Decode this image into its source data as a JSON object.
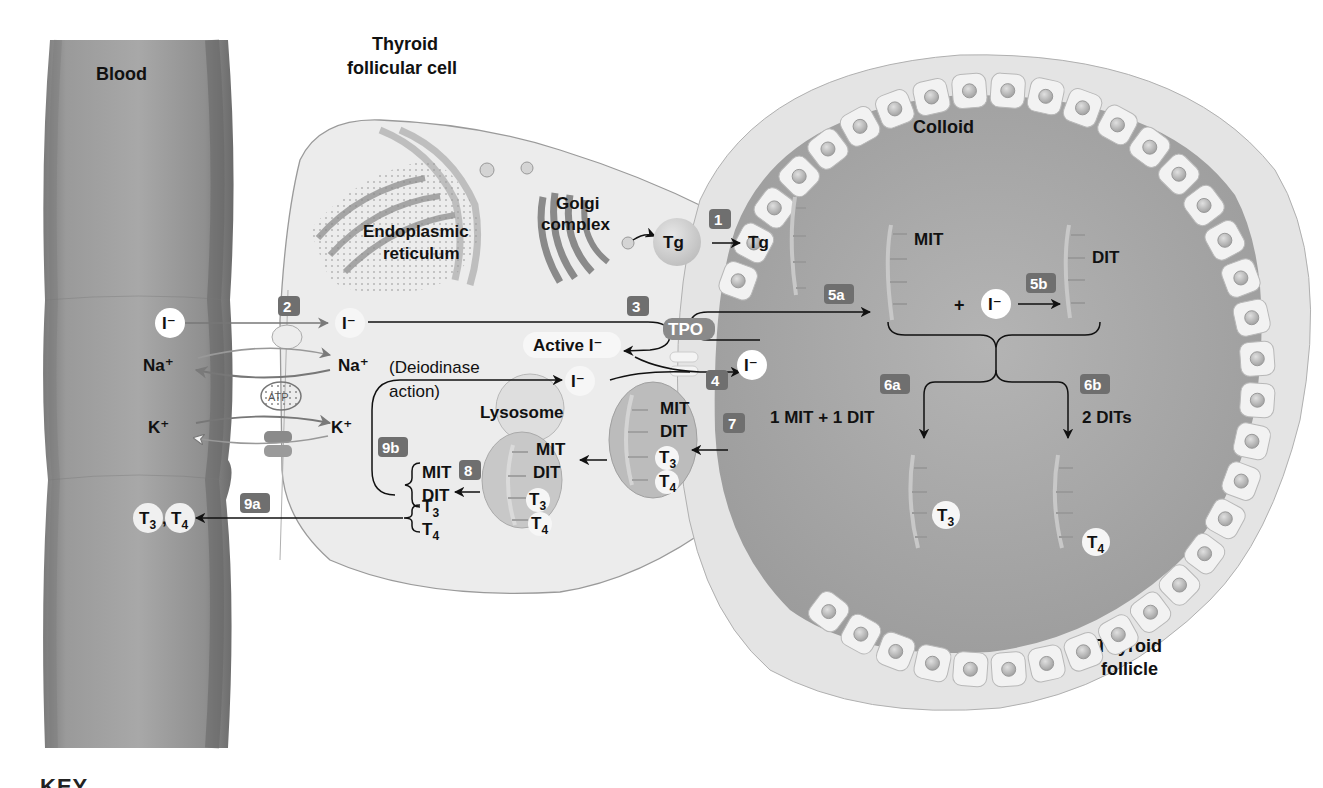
{
  "figure": {
    "key_header": "KEY"
  },
  "regions": {
    "blood": "Blood",
    "cell_title_line1": "Thyroid",
    "cell_title_line2": "follicular cell",
    "colloid": "Colloid",
    "follicle_line1": "Thyroid",
    "follicle_line2": "follicle",
    "er_line1": "Endoplasmic",
    "er_line2": "reticulum",
    "golgi_line1": "Golgi",
    "golgi_line2": "complex",
    "lysosome": "Lysosome"
  },
  "molecules": {
    "tg": "Tg",
    "iodide": "I⁻",
    "active_iodide": "Active I⁻",
    "na": "Na⁺",
    "k": "K⁺",
    "atp": "ATP",
    "tpo": "TPO",
    "mit": "MIT",
    "dit": "DIT",
    "t3": "T",
    "t3_sub": "3",
    "t4": "T",
    "t4_sub": "4",
    "t3_t4_sep": ",",
    "plus": "+",
    "deiodinase_line1": "(Deiodinase",
    "deiodinase_line2": "action)",
    "coupling_6a": "1 MIT + 1 DIT",
    "coupling_6b": "2 DITs"
  },
  "steps": [
    {
      "id": "1",
      "label": "1"
    },
    {
      "id": "2",
      "label": "2"
    },
    {
      "id": "3",
      "label": "3"
    },
    {
      "id": "4",
      "label": "4"
    },
    {
      "id": "5a",
      "label": "5a"
    },
    {
      "id": "5b",
      "label": "5b"
    },
    {
      "id": "6a",
      "label": "6a"
    },
    {
      "id": "6b",
      "label": "6b"
    },
    {
      "id": "7",
      "label": "7"
    },
    {
      "id": "8",
      "label": "8"
    },
    {
      "id": "9a",
      "label": "9a"
    },
    {
      "id": "9b",
      "label": "9b"
    }
  ],
  "colors": {
    "background": "#ffffff",
    "vessel": "#8c8c8c",
    "vessel_edge": "#6a6a6a",
    "cell_cytoplasm": "#ebebeb",
    "colloid": "#a9a9a9",
    "follicle_rim": "#e6e6e6",
    "epithelial_cell": "#f2f2f2",
    "badge": "#6f6f6f",
    "text": "#111111",
    "ion_bubble": "#ffffff"
  }
}
